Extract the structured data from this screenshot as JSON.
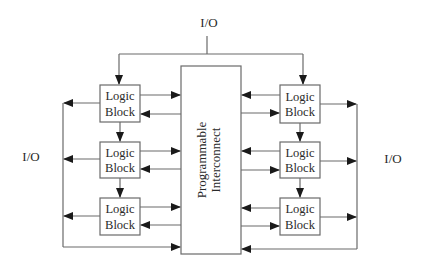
{
  "diagram": {
    "title": "",
    "labels": {
      "io_top": "I/O",
      "io_left": "I/O",
      "io_right": "I/O",
      "interconnect_line1": "Programmable",
      "interconnect_line2": "Interconnect"
    },
    "logic_blocks": {
      "left": [
        {
          "line1": "Logic",
          "line2": "Block"
        },
        {
          "line1": "Logic",
          "line2": "Block"
        },
        {
          "line1": "Logic",
          "line2": "Block"
        }
      ],
      "right": [
        {
          "line1": "Logic",
          "line2": "Block"
        },
        {
          "line1": "Logic",
          "line2": "Block"
        },
        {
          "line1": "Logic",
          "line2": "Block"
        }
      ]
    },
    "colors": {
      "line": "#6a6a6a",
      "arrow": "#1a1a1a",
      "text": "#2a2a2a",
      "background": "#ffffff"
    }
  }
}
